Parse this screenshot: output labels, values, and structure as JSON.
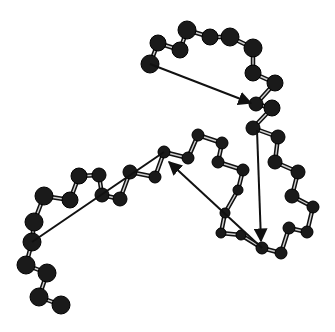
{
  "diagram": {
    "type": "ball-and-stick chain with arrows",
    "colors": {
      "atom": "#1a1a1a",
      "bond": "#111111",
      "bond_highlight": "#cfcfcf",
      "arrow": "#111111",
      "background": "#ffffff"
    },
    "chain_top": [
      [
        150,
        64
      ],
      [
        158,
        43
      ],
      [
        180,
        50
      ],
      [
        187,
        30
      ],
      [
        210,
        37
      ],
      [
        230,
        37
      ],
      [
        253,
        48
      ],
      [
        253,
        73
      ],
      [
        275,
        83
      ],
      [
        256,
        104
      ],
      [
        272,
        108
      ],
      [
        253,
        128
      ],
      [
        278,
        137
      ],
      [
        275,
        162
      ],
      [
        298,
        172
      ],
      [
        292,
        196
      ],
      [
        313,
        207
      ],
      [
        307,
        232
      ],
      [
        289,
        228
      ],
      [
        281,
        253
      ],
      [
        262,
        248
      ]
    ],
    "chain_bottom": [
      [
        262,
        248
      ],
      [
        241,
        235
      ],
      [
        221,
        233
      ],
      [
        225,
        213
      ],
      [
        238,
        190
      ],
      [
        243,
        170
      ],
      [
        218,
        162
      ],
      [
        222,
        143
      ],
      [
        198,
        135
      ],
      [
        188,
        158
      ],
      [
        164,
        152
      ],
      [
        155,
        177
      ],
      [
        130,
        172
      ],
      [
        120,
        199
      ],
      [
        102,
        195
      ],
      [
        99,
        175
      ],
      [
        79,
        176
      ],
      [
        70,
        200
      ],
      [
        44,
        196
      ],
      [
        34,
        222
      ],
      [
        32,
        242
      ],
      [
        26,
        265
      ],
      [
        47,
        273
      ],
      [
        39,
        297
      ],
      [
        61,
        305
      ]
    ],
    "atom_radius": [
      [
        150,
        64,
        9
      ],
      [
        158,
        43,
        8
      ],
      [
        180,
        50,
        8
      ],
      [
        187,
        30,
        9
      ],
      [
        210,
        37,
        8
      ],
      [
        230,
        37,
        9
      ],
      [
        253,
        48,
        9
      ],
      [
        253,
        73,
        8
      ],
      [
        275,
        83,
        8
      ],
      [
        256,
        104,
        7
      ],
      [
        272,
        108,
        8
      ],
      [
        253,
        128,
        7
      ],
      [
        278,
        137,
        7
      ],
      [
        275,
        162,
        7
      ],
      [
        298,
        172,
        7
      ],
      [
        292,
        196,
        7
      ],
      [
        313,
        207,
        6
      ],
      [
        307,
        232,
        6
      ],
      [
        289,
        228,
        6
      ],
      [
        281,
        253,
        6
      ],
      [
        262,
        248,
        6
      ],
      [
        241,
        235,
        5
      ],
      [
        221,
        233,
        5
      ],
      [
        225,
        213,
        5
      ],
      [
        238,
        190,
        5
      ],
      [
        243,
        170,
        6
      ],
      [
        218,
        162,
        6
      ],
      [
        222,
        143,
        6
      ],
      [
        198,
        135,
        6
      ],
      [
        188,
        158,
        6
      ],
      [
        164,
        152,
        6
      ],
      [
        155,
        177,
        6
      ],
      [
        130,
        172,
        7
      ],
      [
        120,
        199,
        7
      ],
      [
        102,
        195,
        7
      ],
      [
        99,
        175,
        7
      ],
      [
        79,
        176,
        8
      ],
      [
        70,
        200,
        8
      ],
      [
        44,
        196,
        9
      ],
      [
        34,
        222,
        9
      ],
      [
        32,
        242,
        9
      ],
      [
        26,
        265,
        9
      ],
      [
        47,
        273,
        9
      ],
      [
        39,
        297,
        9
      ],
      [
        61,
        305,
        9
      ]
    ],
    "arrows": [
      {
        "from": [
          150,
          64
        ],
        "to": [
          251,
          103
        ],
        "head": true
      },
      {
        "from": [
          257,
          130
        ],
        "to": [
          261,
          241
        ],
        "head": true
      },
      {
        "from": [
          262,
          248
        ],
        "to": [
          169,
          162
        ],
        "head": true
      },
      {
        "from": [
          32,
          242
        ],
        "to": [
          164,
          152
        ],
        "head": false
      }
    ]
  }
}
